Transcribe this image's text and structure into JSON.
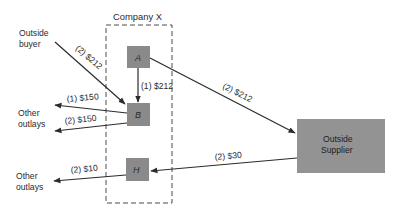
{
  "title": "Company X",
  "colors": {
    "node_fill": "#8a8a8a",
    "supplier_fill": "#939393",
    "line": "#2b2b2b",
    "background": "#ffffff"
  },
  "nodes": {
    "a": "A",
    "b": "B",
    "h": "H",
    "supplier_line1": "Outside",
    "supplier_line2": "Supplier"
  },
  "external": {
    "buyer_line1": "Outside",
    "buyer_line2": "buyer",
    "outlays1_line1": "Other",
    "outlays1_line2": "outlays",
    "outlays2_line1": "Other",
    "outlays2_line2": "outlays"
  },
  "flows": {
    "buyer_to_b": "(2) $212",
    "a_to_b": "(1) $212",
    "a_to_supplier": "(2) $212",
    "b_to_outlays_1": "(1) $150",
    "b_to_outlays_2": "(2) $150",
    "supplier_to_h": "(2) $30",
    "h_to_outlays": "(2) $10"
  }
}
